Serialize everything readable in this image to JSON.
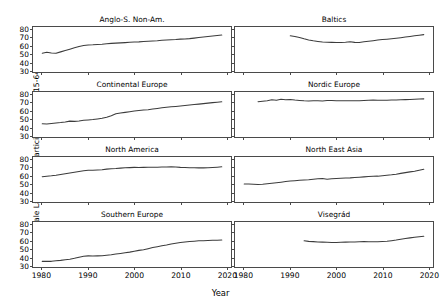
{
  "chart_data": {
    "type": "line",
    "title": "",
    "xlabel": "Year",
    "ylabel": "Female Labor Force Participation (age 15-64)",
    "xlim": [
      1978,
      2021
    ],
    "ylim": [
      28,
      83
    ],
    "xticks": [
      1980,
      1990,
      2000,
      2010,
      2020
    ],
    "yticks": [
      30,
      40,
      50,
      60,
      70,
      80
    ],
    "grid": false,
    "legend": "none",
    "layout": {
      "rows": 4,
      "cols": 2
    },
    "line_color": "#3c3c3c",
    "panels": [
      {
        "title": "Anglo-S. Non-Am.",
        "row": 0,
        "col": 0,
        "x": [
          1980,
          1981,
          1982,
          1983,
          1984,
          1985,
          1986,
          1987,
          1988,
          1989,
          1990,
          1991,
          1992,
          1993,
          1994,
          1995,
          1996,
          1997,
          1998,
          1999,
          2000,
          2001,
          2002,
          2003,
          2004,
          2005,
          2006,
          2007,
          2008,
          2009,
          2010,
          2011,
          2012,
          2013,
          2014,
          2015,
          2016,
          2017,
          2018,
          2019
        ],
        "y": [
          51.0,
          52.2,
          51.2,
          50.9,
          52.6,
          54.2,
          55.9,
          57.6,
          59.2,
          60.3,
          61.0,
          61.2,
          61.7,
          62.0,
          62.6,
          63.0,
          63.3,
          63.6,
          63.9,
          64.3,
          64.6,
          64.8,
          65.2,
          65.6,
          65.9,
          66.2,
          66.7,
          67.1,
          67.5,
          67.7,
          68.2,
          68.4,
          68.8,
          69.4,
          70.1,
          70.7,
          71.3,
          71.9,
          72.6,
          73.2
        ]
      },
      {
        "title": "Baltics",
        "row": 0,
        "col": 1,
        "x": [
          1990,
          1991,
          1992,
          1993,
          1994,
          1995,
          1996,
          1997,
          1998,
          1999,
          2000,
          2001,
          2002,
          2003,
          2004,
          2005,
          2006,
          2007,
          2008,
          2009,
          2010,
          2011,
          2012,
          2013,
          2014,
          2015,
          2016,
          2017,
          2018,
          2019
        ],
        "y": [
          72.3,
          71.5,
          70.2,
          68.6,
          67.2,
          66.2,
          65.4,
          64.7,
          64.4,
          64.2,
          64.1,
          64.0,
          64.3,
          64.9,
          64.2,
          64.1,
          64.9,
          65.6,
          66.3,
          67.0,
          67.6,
          68.1,
          68.6,
          69.2,
          69.9,
          70.7,
          71.5,
          72.2,
          73.0,
          73.7
        ]
      },
      {
        "title": "Continental Europe",
        "row": 1,
        "col": 0,
        "x": [
          1980,
          1981,
          1982,
          1983,
          1984,
          1985,
          1986,
          1987,
          1988,
          1989,
          1990,
          1991,
          1992,
          1993,
          1994,
          1995,
          1996,
          1997,
          1998,
          1999,
          2000,
          2001,
          2002,
          2003,
          2004,
          2005,
          2006,
          2007,
          2008,
          2009,
          2010,
          2011,
          2012,
          2013,
          2014,
          2015,
          2016,
          2017,
          2018,
          2019
        ],
        "y": [
          44.2,
          43.8,
          44.6,
          45.2,
          45.6,
          46.3,
          47.4,
          47.1,
          47.5,
          48.4,
          48.8,
          49.3,
          50.1,
          51.0,
          52.2,
          54.0,
          56.3,
          57.4,
          58.1,
          58.9,
          59.7,
          60.3,
          60.9,
          61.4,
          62.1,
          62.9,
          63.7,
          64.4,
          65.0,
          65.4,
          65.9,
          66.4,
          67.0,
          67.6,
          68.2,
          68.8,
          69.4,
          70.0,
          70.6,
          71.1
        ]
      },
      {
        "title": "Nordic Europe",
        "row": 1,
        "col": 1,
        "x": [
          1983,
          1984,
          1985,
          1986,
          1987,
          1988,
          1989,
          1990,
          1991,
          1992,
          1993,
          1994,
          1995,
          1996,
          1997,
          1998,
          1999,
          2000,
          2001,
          2002,
          2003,
          2004,
          2005,
          2006,
          2007,
          2008,
          2009,
          2010,
          2011,
          2012,
          2013,
          2014,
          2015,
          2016,
          2017,
          2018,
          2019
        ],
        "y": [
          71.1,
          71.8,
          72.4,
          73.5,
          73.0,
          74.1,
          73.6,
          73.9,
          73.1,
          72.6,
          72.2,
          72.0,
          72.3,
          72.2,
          72.1,
          72.6,
          72.5,
          72.4,
          72.3,
          72.3,
          72.2,
          72.4,
          72.3,
          72.7,
          73.0,
          73.2,
          72.9,
          72.8,
          72.9,
          73.1,
          73.2,
          73.5,
          73.7,
          73.9,
          74.2,
          74.4,
          74.6
        ]
      },
      {
        "title": "North America",
        "row": 2,
        "col": 0,
        "x": [
          1980,
          1981,
          1982,
          1983,
          1984,
          1985,
          1986,
          1987,
          1988,
          1989,
          1990,
          1991,
          1992,
          1993,
          1994,
          1995,
          1996,
          1997,
          1998,
          1999,
          2000,
          2001,
          2002,
          2003,
          2004,
          2005,
          2006,
          2007,
          2008,
          2009,
          2010,
          2011,
          2012,
          2013,
          2014,
          2015,
          2016,
          2017,
          2018,
          2019
        ],
        "y": [
          58.8,
          59.5,
          60.0,
          60.7,
          61.7,
          62.6,
          63.5,
          64.4,
          65.2,
          66.1,
          66.8,
          66.9,
          67.2,
          67.4,
          68.2,
          68.6,
          68.9,
          69.4,
          69.8,
          70.0,
          70.3,
          70.2,
          70.3,
          70.5,
          70.4,
          70.5,
          70.7,
          70.9,
          71.0,
          70.7,
          70.3,
          70.1,
          69.9,
          69.8,
          69.7,
          69.7,
          69.9,
          70.2,
          70.6,
          71.0
        ]
      },
      {
        "title": "North East Asia",
        "row": 2,
        "col": 1,
        "x": [
          1980,
          1981,
          1982,
          1983,
          1984,
          1985,
          1986,
          1987,
          1988,
          1989,
          1990,
          1991,
          1992,
          1993,
          1994,
          1995,
          1996,
          1997,
          1998,
          1999,
          2000,
          2001,
          2002,
          2003,
          2004,
          2005,
          2006,
          2007,
          2008,
          2009,
          2010,
          2011,
          2012,
          2013,
          2014,
          2015,
          2016,
          2017,
          2018,
          2019
        ],
        "y": [
          49.9,
          50.0,
          49.6,
          49.3,
          49.6,
          50.2,
          50.9,
          51.5,
          52.2,
          53.0,
          53.6,
          54.1,
          54.6,
          54.9,
          55.3,
          55.9,
          56.3,
          56.6,
          55.9,
          56.3,
          56.8,
          57.0,
          57.3,
          57.5,
          58.0,
          58.3,
          58.7,
          59.2,
          59.4,
          59.6,
          60.1,
          60.6,
          61.2,
          62.0,
          63.0,
          63.9,
          64.8,
          65.6,
          66.8,
          68.0
        ]
      },
      {
        "title": "Southern Europe",
        "row": 3,
        "col": 0,
        "x": [
          1980,
          1981,
          1982,
          1983,
          1984,
          1985,
          1986,
          1987,
          1988,
          1989,
          1990,
          1991,
          1992,
          1993,
          1994,
          1995,
          1996,
          1997,
          1998,
          1999,
          2000,
          2001,
          2002,
          2003,
          2004,
          2005,
          2006,
          2007,
          2008,
          2009,
          2010,
          2011,
          2012,
          2013,
          2014,
          2015,
          2016,
          2017,
          2018,
          2019
        ],
        "y": [
          34.9,
          35.1,
          34.9,
          35.6,
          36.1,
          36.8,
          37.6,
          38.6,
          40.0,
          41.1,
          41.6,
          41.5,
          41.6,
          41.8,
          42.4,
          43.0,
          43.8,
          44.5,
          45.3,
          46.2,
          47.3,
          48.3,
          49.0,
          50.4,
          51.8,
          52.8,
          53.9,
          54.8,
          56.0,
          57.0,
          57.9,
          58.6,
          59.2,
          59.6,
          60.0,
          60.2,
          60.5,
          60.7,
          60.8,
          61.0
        ]
      },
      {
        "title": "Visegrád",
        "row": 3,
        "col": 1,
        "x": [
          1993,
          1994,
          1995,
          1996,
          1997,
          1998,
          1999,
          2000,
          2001,
          2002,
          2003,
          2004,
          2005,
          2006,
          2007,
          2008,
          2009,
          2010,
          2011,
          2012,
          2013,
          2014,
          2015,
          2016,
          2017,
          2018,
          2019
        ],
        "y": [
          60.0,
          59.3,
          59.0,
          58.6,
          58.4,
          58.2,
          57.9,
          58.0,
          58.2,
          58.4,
          58.5,
          58.6,
          58.9,
          59.0,
          58.9,
          58.8,
          58.9,
          59.1,
          59.4,
          60.2,
          61.0,
          62.0,
          62.8,
          63.6,
          64.3,
          65.0,
          65.6
        ]
      }
    ]
  }
}
